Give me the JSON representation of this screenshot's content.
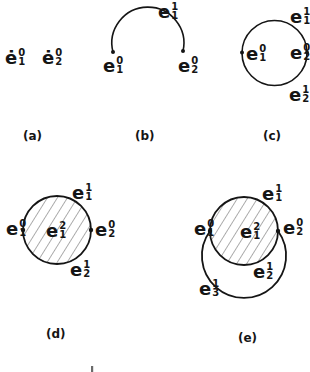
{
  "figure": {
    "colors": {
      "ink": "#151515",
      "background": "#ffffff",
      "hatch": "#4a4a4a"
    },
    "panels": {
      "a": {
        "caption": "(a)",
        "labels": {
          "p1": {
            "base": "ė",
            "sup": "0",
            "sub": "1"
          },
          "p2": {
            "base": "ė",
            "sup": "0",
            "sub": "2"
          }
        }
      },
      "b": {
        "caption": "(b)",
        "labels": {
          "arc": {
            "base": "e",
            "sup": "1",
            "sub": "1"
          },
          "left": {
            "base": "e",
            "sup": "0",
            "sub": "1"
          },
          "right": {
            "base": "e",
            "sup": "0",
            "sub": "2"
          }
        }
      },
      "c": {
        "caption": "(c)",
        "labels": {
          "top": {
            "base": "e",
            "sup": "1",
            "sub": "1"
          },
          "left": {
            "base": "e",
            "sup": "0",
            "sub": "1"
          },
          "right": {
            "base": "e",
            "sup": "0",
            "sub": "2"
          },
          "bottom": {
            "base": "e",
            "sup": "1",
            "sub": "2"
          }
        }
      },
      "d": {
        "caption": "(d)",
        "labels": {
          "top": {
            "base": "e",
            "sup": "1",
            "sub": "1"
          },
          "left": {
            "base": "e",
            "sup": "0",
            "sub": "1"
          },
          "face": {
            "base": "e",
            "sup": "2",
            "sub": "1"
          },
          "right": {
            "base": "e",
            "sup": "0",
            "sub": "2"
          },
          "bottom": {
            "base": "e",
            "sup": "1",
            "sub": "2"
          }
        }
      },
      "e": {
        "caption": "(e)",
        "labels": {
          "top": {
            "base": "e",
            "sup": "1",
            "sub": "1"
          },
          "left": {
            "base": "e",
            "sup": "0",
            "sub": "1"
          },
          "face": {
            "base": "e",
            "sup": "2",
            "sub": "1"
          },
          "right": {
            "base": "e",
            "sup": "0",
            "sub": "2"
          },
          "bottom": {
            "base": "e",
            "sup": "1",
            "sub": "2"
          },
          "extra": {
            "base": "e",
            "sup": "1",
            "sub": "3"
          }
        }
      }
    }
  }
}
